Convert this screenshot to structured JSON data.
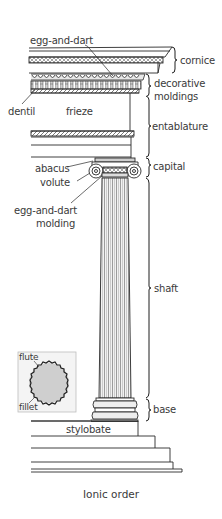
{
  "title": "Ionic order",
  "colors": {
    "line": "#2a2a2a",
    "text": "#3a3a3a",
    "fill_light": "#e6e6e6",
    "fill_mid": "#c8c8c8",
    "inset_fill": "#cfcfcf"
  },
  "labels": {
    "left": {
      "egg_and_dart": "egg-and-dart",
      "dentil": "dentil",
      "frieze": "frieze",
      "abacus": "abacus",
      "volute": "volute",
      "egg_and_dart_molding_1": "egg-and-dart",
      "egg_and_dart_molding_2": "molding",
      "stylobate": "stylobate"
    },
    "right": {
      "cornice": "cornice",
      "decorative_moldings_1": "decorative",
      "decorative_moldings_2": "moldings",
      "entablature": "entablature",
      "capital": "capital",
      "shaft": "shaft",
      "base": "base"
    },
    "inset": {
      "flute": "flute",
      "fillet": "fillet"
    }
  }
}
